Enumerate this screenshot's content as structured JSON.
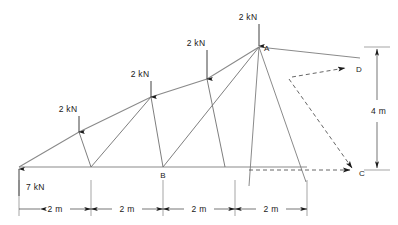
{
  "figure": {
    "span_total_m": 8,
    "height_m": 4
  },
  "loads": [
    {
      "id": "load-1",
      "label": "2 kN",
      "label_x": 68,
      "label_y": 112,
      "tip_x": 79,
      "tip_y": 132,
      "tail_y": 116
    },
    {
      "id": "load-2",
      "label": "2 kN",
      "label_x": 140,
      "label_y": 77,
      "tip_x": 151,
      "tip_y": 97,
      "tail_y": 81
    },
    {
      "id": "load-3",
      "label": "2 kN",
      "label_x": 196,
      "label_y": 46,
      "tip_x": 207,
      "tip_y": 79,
      "tail_y": 50
    },
    {
      "id": "load-4",
      "label": "2 kN",
      "label_x": 248,
      "label_y": 20,
      "tip_x": 259,
      "tip_y": 46,
      "tail_y": 24
    }
  ],
  "reaction": {
    "label": "7 kN",
    "label_x": 26,
    "label_y": 190,
    "tip_x": 19,
    "tip_y": 168,
    "tail_y": 196
  },
  "nodes": [
    {
      "name": "A",
      "label": "A",
      "x": 259,
      "y": 47,
      "label_x": 264,
      "label_y": 49
    },
    {
      "name": "B",
      "label": "B",
      "x": 163,
      "y": 167,
      "label_x": 160,
      "label_y": 177
    },
    {
      "name": "C",
      "label": "C",
      "x": 354,
      "y": 170,
      "label_x": 358,
      "label_y": 175
    },
    {
      "name": "D",
      "label": "D",
      "x": 344,
      "y": 69,
      "label_x": 355,
      "label_y": 71
    }
  ],
  "dimensions": {
    "horizontal": [
      {
        "label": "2 m",
        "x1": 19,
        "x2": 91,
        "label_x": 55,
        "label_y": 212
      },
      {
        "label": "2 m",
        "x1": 91,
        "x2": 163,
        "label_x": 127,
        "label_y": 212
      },
      {
        "label": "2 m",
        "x1": 163,
        "x2": 235,
        "label_x": 199,
        "label_y": 212
      },
      {
        "label": "2 m",
        "x1": 235,
        "x2": 307,
        "label_x": 271,
        "label_y": 212
      }
    ],
    "horizontal_y": 209,
    "vertical": {
      "label": "4 m",
      "x": 377,
      "y1": 47,
      "y2": 170,
      "label_x": 381,
      "label_y": 112
    }
  },
  "geometry": {
    "support_x": 19,
    "support_y": 167,
    "bottom_chord_x2": 307,
    "apex_x": 259,
    "apex_y": 47,
    "top_nodes": [
      {
        "x": 79,
        "y": 132
      },
      {
        "x": 151,
        "y": 97
      },
      {
        "x": 207,
        "y": 79
      },
      {
        "x": 259,
        "y": 47
      }
    ],
    "bottom_nodes": [
      {
        "x": 91,
        "y": 167
      },
      {
        "x": 163,
        "y": 167
      }
    ]
  },
  "force_polygon": {
    "description": "force-triangle-overlay",
    "ray_1": {
      "x1": 259,
      "y1": 47,
      "x2": 360,
      "y2": 58
    },
    "ray_2": {
      "x1": 259,
      "y1": 47,
      "x2": 306,
      "y2": 182
    },
    "ray_3": {
      "x1": 259,
      "y1": 47,
      "x2": 249,
      "y2": 186
    },
    "dash_d": {
      "x1": 292,
      "y1": 77,
      "x2": 348,
      "y2": 68
    },
    "dash_c": {
      "x1": 289,
      "y1": 79,
      "x2": 354,
      "y2": 170
    },
    "dash_base": {
      "x1": 249,
      "y1": 170,
      "x2": 352,
      "y2": 170
    }
  }
}
